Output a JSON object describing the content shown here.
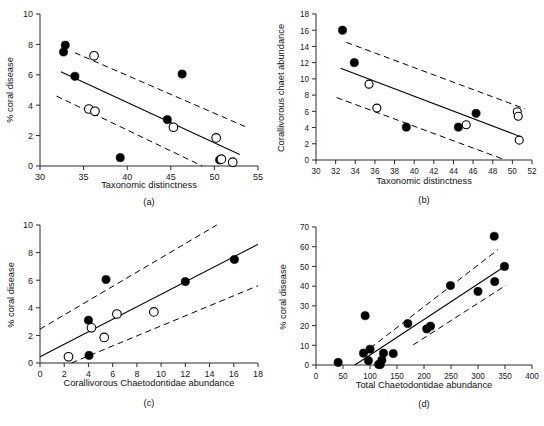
{
  "figure": {
    "name": "coral-disease-chaetodontidae-figure",
    "panel_count": 4
  },
  "chart_data": [
    {
      "id": "a",
      "type": "scatter",
      "caption": "(a)",
      "title": "",
      "xlabel": "Taxonomic distinctness",
      "ylabel": "% coral disease",
      "xlim": [
        30,
        55
      ],
      "ylim": [
        0,
        10
      ],
      "xticks": [
        30,
        35,
        40,
        45,
        50,
        55
      ],
      "yticks": [
        0,
        2,
        4,
        6,
        8,
        10
      ],
      "grid": false,
      "legend": "none",
      "series": [
        {
          "name": "filled",
          "marker": "filled-circle",
          "points": [
            {
              "x": 32.9,
              "y": 7.95
            },
            {
              "x": 32.7,
              "y": 7.5
            },
            {
              "x": 34.0,
              "y": 5.9
            },
            {
              "x": 39.2,
              "y": 0.55
            },
            {
              "x": 44.6,
              "y": 3.05
            },
            {
              "x": 46.3,
              "y": 6.05
            },
            {
              "x": 50.6,
              "y": 0.4
            }
          ]
        },
        {
          "name": "open",
          "marker": "open-circle",
          "points": [
            {
              "x": 36.2,
              "y": 7.25
            },
            {
              "x": 35.6,
              "y": 3.75
            },
            {
              "x": 36.3,
              "y": 3.6
            },
            {
              "x": 45.3,
              "y": 2.55
            },
            {
              "x": 50.2,
              "y": 1.85
            },
            {
              "x": 50.8,
              "y": 0.45
            },
            {
              "x": 52.1,
              "y": 0.25
            }
          ]
        }
      ],
      "fit_line": {
        "x0": 32.4,
        "y0": 6.2,
        "x1": 52.9,
        "y1": 0.75
      },
      "ci_upper": {
        "x0": 34.0,
        "y0": 7.45,
        "x1": 53.5,
        "y1": 2.6
      },
      "ci_lower": {
        "x0": 31.9,
        "y0": 4.6,
        "x1": 48.6,
        "y1": 0.0
      }
    },
    {
      "id": "b",
      "type": "scatter",
      "caption": "(b)",
      "title": "",
      "xlabel": "Taxonomic distinctness",
      "ylabel": "Corallivorous chaet abundance",
      "xlim": [
        30,
        52
      ],
      "ylim": [
        0,
        18
      ],
      "xticks": [
        30,
        32,
        34,
        36,
        38,
        40,
        42,
        44,
        46,
        48,
        50,
        52
      ],
      "yticks": [
        0,
        2,
        4,
        6,
        8,
        10,
        12,
        14,
        16,
        18
      ],
      "grid": false,
      "legend": "none",
      "series": [
        {
          "name": "filled",
          "marker": "filled-circle",
          "points": [
            {
              "x": 32.7,
              "y": 16.0
            },
            {
              "x": 33.9,
              "y": 12.0
            },
            {
              "x": 39.2,
              "y": 4.05
            },
            {
              "x": 44.5,
              "y": 4.05
            },
            {
              "x": 46.3,
              "y": 5.75
            }
          ]
        },
        {
          "name": "open",
          "marker": "open-circle",
          "points": [
            {
              "x": 35.4,
              "y": 9.35
            },
            {
              "x": 36.2,
              "y": 6.4
            },
            {
              "x": 45.3,
              "y": 4.35
            },
            {
              "x": 50.5,
              "y": 5.95
            },
            {
              "x": 50.6,
              "y": 5.4
            },
            {
              "x": 50.7,
              "y": 2.45
            }
          ]
        }
      ],
      "fit_line": {
        "x0": 32.5,
        "y0": 11.3,
        "x1": 50.9,
        "y1": 2.85
      },
      "ci_upper": {
        "x0": 33.1,
        "y0": 14.5,
        "x1": 51.3,
        "y1": 6.3
      },
      "ci_lower": {
        "x0": 32.1,
        "y0": 7.7,
        "x1": 49.3,
        "y1": 0.0
      }
    },
    {
      "id": "c",
      "type": "scatter",
      "caption": "(c)",
      "title": "",
      "xlabel": "Corallivorous Chaetodontidae abundance",
      "ylabel": "% coral disease",
      "xlim": [
        0,
        18
      ],
      "ylim": [
        0,
        10
      ],
      "xticks": [
        0,
        2,
        4,
        6,
        8,
        10,
        12,
        14,
        16,
        18
      ],
      "yticks": [
        0,
        2,
        4,
        6,
        8,
        10
      ],
      "grid": false,
      "legend": "none",
      "series": [
        {
          "name": "filled",
          "marker": "filled-circle",
          "points": [
            {
              "x": 4.0,
              "y": 3.1
            },
            {
              "x": 4.05,
              "y": 0.55
            },
            {
              "x": 5.45,
              "y": 6.05
            },
            {
              "x": 12.0,
              "y": 5.9
            },
            {
              "x": 16.05,
              "y": 7.5
            }
          ]
        },
        {
          "name": "open",
          "marker": "open-circle",
          "points": [
            {
              "x": 2.35,
              "y": 0.45
            },
            {
              "x": 4.25,
              "y": 2.55
            },
            {
              "x": 5.3,
              "y": 1.85
            },
            {
              "x": 6.35,
              "y": 3.55
            },
            {
              "x": 9.4,
              "y": 3.7
            }
          ]
        }
      ],
      "fit_line": {
        "x0": 0.0,
        "y0": 0.45,
        "x1": 18.0,
        "y1": 8.6
      },
      "ci_upper": {
        "x0": 0.0,
        "y0": 2.45,
        "x1": 14.6,
        "y1": 10.0
      },
      "ci_lower": {
        "x0": 2.6,
        "y0": 0.0,
        "x1": 18.0,
        "y1": 5.6
      }
    },
    {
      "id": "d",
      "type": "scatter",
      "caption": "(d)",
      "title": "",
      "xlabel": "Total Chaetodontidae abundance",
      "ylabel": "% coral disease",
      "xlim": [
        0,
        400
      ],
      "ylim": [
        0,
        70
      ],
      "xticks": [
        0,
        50,
        100,
        150,
        200,
        250,
        300,
        350,
        400
      ],
      "yticks": [
        0,
        10,
        20,
        30,
        40,
        50,
        60,
        70
      ],
      "grid": false,
      "legend": "none",
      "series": [
        {
          "name": "filled",
          "marker": "filled-circle",
          "points": [
            {
              "x": 41,
              "y": 1.3
            },
            {
              "x": 88,
              "y": 6.0
            },
            {
              "x": 91,
              "y": 25.0
            },
            {
              "x": 100,
              "y": 8.0
            },
            {
              "x": 97,
              "y": 2.2
            },
            {
              "x": 116,
              "y": 0.3
            },
            {
              "x": 119,
              "y": 0.2
            },
            {
              "x": 122,
              "y": 2.5
            },
            {
              "x": 125,
              "y": 6.0
            },
            {
              "x": 143,
              "y": 5.8
            },
            {
              "x": 170,
              "y": 21.0
            },
            {
              "x": 205,
              "y": 18.3
            },
            {
              "x": 212,
              "y": 19.7
            },
            {
              "x": 249,
              "y": 40.3
            },
            {
              "x": 300,
              "y": 37.3
            },
            {
              "x": 330,
              "y": 65.3
            },
            {
              "x": 331,
              "y": 42.3
            },
            {
              "x": 349,
              "y": 50.0
            }
          ]
        }
      ],
      "fit_line": {
        "x0": 72,
        "y0": 0.0,
        "x1": 352,
        "y1": 50.5
      },
      "ci_upper": {
        "x0": 86,
        "y0": 5.5,
        "x1": 337,
        "y1": 58.5
      },
      "ci_lower": {
        "x0": 180,
        "y0": 10.2,
        "x1": 352,
        "y1": 40.5
      }
    }
  ]
}
